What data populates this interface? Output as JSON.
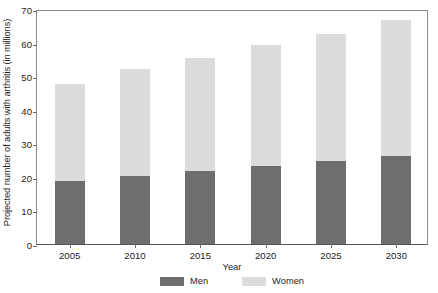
{
  "chart_data": {
    "type": "bar",
    "subtype": "stacked-vertical",
    "title": "",
    "xlabel": "Year",
    "ylabel": "Projected number of adults with arthritis (in millions)",
    "categories": [
      "2005",
      "2010",
      "2015",
      "2020",
      "2025",
      "2030"
    ],
    "series": [
      {
        "name": "Men",
        "color": "#6e6e6e",
        "values": [
          18.8,
          20.3,
          21.7,
          23.2,
          24.7,
          26.2
        ]
      },
      {
        "name": "Women",
        "color": "#dcdcdc",
        "values": [
          29.0,
          31.7,
          33.8,
          36.1,
          38.0,
          40.5
        ]
      }
    ],
    "totals": [
      47.8,
      52.0,
      55.5,
      59.3,
      62.7,
      66.7
    ],
    "ylim": [
      0,
      70
    ],
    "yticks": [
      0,
      10,
      20,
      30,
      40,
      50,
      60,
      70
    ],
    "ytick_labels": [
      "0",
      "10",
      "20",
      "30",
      "40",
      "50",
      "60",
      "70"
    ],
    "grid": false,
    "legend_position": "bottom"
  },
  "legend": {
    "items": [
      {
        "label": "Men",
        "color": "#6e6e6e"
      },
      {
        "label": "Women",
        "color": "#dcdcdc"
      }
    ]
  }
}
